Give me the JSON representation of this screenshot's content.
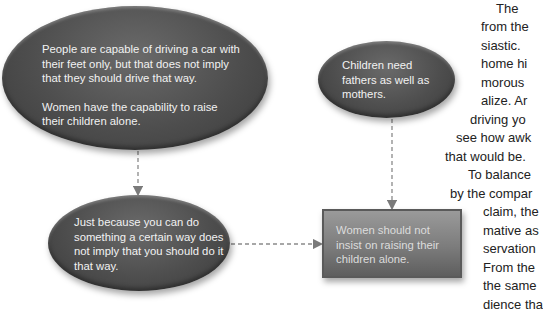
{
  "diagram": {
    "nodes": [
      {
        "id": "premise-1",
        "shape": "ellipse",
        "paragraphs": [
          "People are capable of driving a car with their feet only, but that does not imply that they should drive that way.",
          "Women have the capability to raise their children alone."
        ]
      },
      {
        "id": "premise-2",
        "shape": "ellipse",
        "text": "Children need fathers as well as mothers."
      },
      {
        "id": "warrant",
        "shape": "ellipse",
        "text": "Just because you can do something a certain way does not imply that you should do it that way."
      },
      {
        "id": "conclusion",
        "shape": "rectangle",
        "text": "Women should not insist on raising their children alone."
      }
    ],
    "edges": [
      {
        "from": "premise-1",
        "to": "warrant",
        "style": "dashed-arrow"
      },
      {
        "from": "premise-2",
        "to": "conclusion",
        "style": "dashed-arrow"
      },
      {
        "from": "warrant",
        "to": "conclusion",
        "style": "dashed-arrow"
      }
    ],
    "colors": {
      "ellipse_fill": "#4e4e4e",
      "box_fill": "#7c7c7c",
      "arrow": "#8a8a8a",
      "node_text": "#f2f2f2"
    }
  },
  "side_text": {
    "lines": [
      "The",
      "from the",
      "siastic.",
      "home hi",
      "morous",
      "alize. Ar",
      "driving yo",
      "see how awk",
      "that would be.",
      "To balance",
      "by the compar",
      "claim, the",
      "mative as",
      "servation",
      "From the",
      "the same",
      "dience tha"
    ]
  }
}
